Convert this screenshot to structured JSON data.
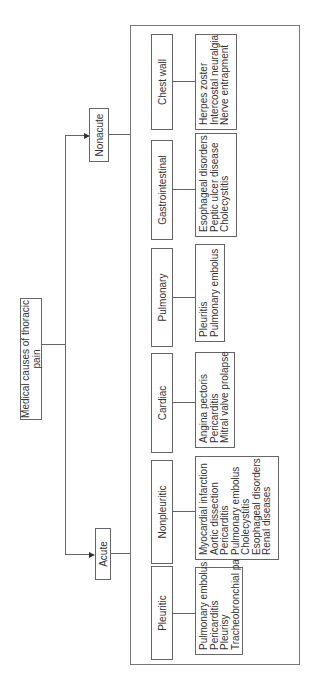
{
  "title": "Medical causes of thoracic pain",
  "branches": {
    "nonacute": {
      "label": "Nonacute",
      "categories": [
        {
          "label": "Chest wall",
          "items": [
            "Herpes zoster",
            "Intercostal neuralgia",
            "Nerve entrapment"
          ]
        },
        {
          "label": "Gastrointestinal",
          "items": [
            "Esophageal disorders",
            "Peptic ulcer disease",
            "Cholecystitis"
          ]
        },
        {
          "label": "Pulmonary",
          "items": [
            "Pleuritis",
            "Pulmonary embolus"
          ]
        },
        {
          "label": "Cardiac",
          "items": [
            "Angina pectoris",
            "Pericarditis",
            "Mitral valve prolapse"
          ]
        }
      ]
    },
    "acute": {
      "label": "Acute",
      "categories": [
        {
          "label": "Nonpleuritic",
          "items": [
            "Myocardial infarction",
            "Aortic dissection",
            "Pericarditis",
            "Pulmonary embolus",
            "Cholecystitis",
            "Esophageal disorders",
            "Renal diseases"
          ]
        },
        {
          "label": "Pleuritic",
          "items": [
            "Pulmonary embolus",
            "Pericarditis",
            "Pleurisy",
            "Tracheobronchial pain"
          ]
        }
      ]
    }
  },
  "colors": {
    "line": "#666666",
    "text": "#333333",
    "background": "#ffffff"
  }
}
